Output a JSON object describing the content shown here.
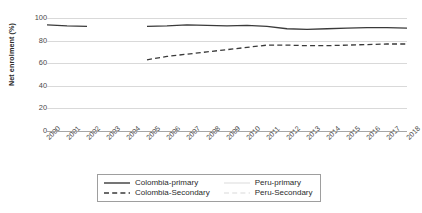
{
  "chart_data": {
    "type": "line",
    "title": "",
    "xlabel": "",
    "ylabel": "Net enrolment (%)",
    "ylim": [
      0,
      100
    ],
    "yticks": [
      0,
      20,
      40,
      60,
      80,
      100
    ],
    "grid": true,
    "legend_position": "bottom",
    "x": [
      2000,
      2001,
      2002,
      2003,
      2004,
      2005,
      2006,
      2007,
      2008,
      2009,
      2010,
      2011,
      2012,
      2013,
      2014,
      2015,
      2016,
      2017,
      2018
    ],
    "series": [
      {
        "name": "Colombia-primary",
        "color": "#3a3a3a",
        "style": "solid",
        "values": [
          94,
          93,
          92.5,
          null,
          null,
          92.5,
          93,
          94,
          93.5,
          93,
          93.5,
          92.5,
          90.5,
          90,
          90.5,
          91,
          91.5,
          91.5,
          91
        ]
      },
      {
        "name": "Colombia-Secondary",
        "color": "#3a3a3a",
        "style": "dashed",
        "values": [
          null,
          null,
          null,
          null,
          null,
          63,
          66,
          68,
          70,
          72,
          74,
          76,
          76,
          75.5,
          75.5,
          76,
          76.5,
          77,
          77
        ]
      },
      {
        "name": "Peru-primary",
        "color": "#e2e2e2",
        "style": "solid",
        "values": [
          null,
          null,
          null,
          null,
          null,
          null,
          null,
          null,
          null,
          null,
          null,
          null,
          null,
          null,
          null,
          null,
          null,
          null,
          null
        ]
      },
      {
        "name": "Peru-Secondary",
        "color": "#e2e2e2",
        "style": "dashed",
        "values": [
          null,
          null,
          null,
          null,
          null,
          null,
          null,
          null,
          null,
          null,
          null,
          null,
          null,
          null,
          null,
          null,
          null,
          null,
          null
        ]
      }
    ]
  },
  "legend": {
    "items": [
      {
        "label": "Colombia-primary",
        "color": "#3a3a3a",
        "style": "solid"
      },
      {
        "label": "Peru-primary",
        "color": "#e6e6e6",
        "style": "solid"
      },
      {
        "label": "Colombia-Secondary",
        "color": "#3a3a3a",
        "style": "dashed"
      },
      {
        "label": "Peru-Secondary",
        "color": "#e6e6e6",
        "style": "dashed"
      }
    ]
  }
}
